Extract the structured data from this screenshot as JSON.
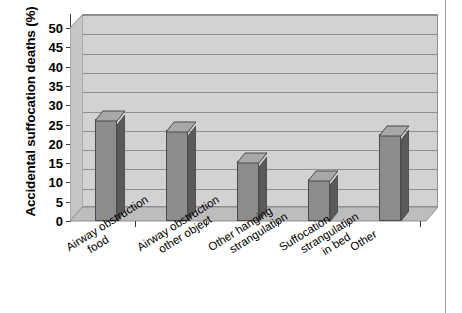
{
  "chart_data": {
    "type": "bar",
    "title": "",
    "subtitle": "",
    "xlabel": "",
    "ylabel": "Accidental suffocation deaths (%)",
    "categories": [
      "Airway obstruction food",
      "Airway obstruction other object",
      "Other hanging strangulation",
      "Suffocation strangulation in bed",
      "Other"
    ],
    "category_lines": [
      [
        "Airway obstruction",
        "food"
      ],
      [
        "Airway obstruction",
        "other object"
      ],
      [
        "Other hanging",
        "strangulation"
      ],
      [
        "Suffocation",
        "strangulation",
        "in bed"
      ],
      [
        "Other"
      ]
    ],
    "values": [
      26.5,
      23.5,
      15.5,
      11,
      22.5
    ],
    "ylim": [
      0,
      50
    ],
    "ytick_labels": [
      "0",
      "5",
      "10",
      "15",
      "20",
      "25",
      "30",
      "35",
      "40",
      "45",
      "50"
    ],
    "ytick_values": [
      0,
      5,
      10,
      15,
      20,
      25,
      30,
      35,
      40,
      45,
      50
    ],
    "grid": true,
    "legend": "none",
    "style": "3d-column",
    "colors": {
      "bar_face": "#8c8c8c",
      "bar_side": "#5a5a5a",
      "bar_top": "#a8a8a8",
      "bar_outline": "#4a4a4a",
      "plot_background": "#d2d2d2",
      "floor": "#bdbdbd",
      "gridline": "#8f8f8f",
      "axis": "#3a3a3a",
      "text": "#000000",
      "figure_background": "#ffffff"
    }
  }
}
